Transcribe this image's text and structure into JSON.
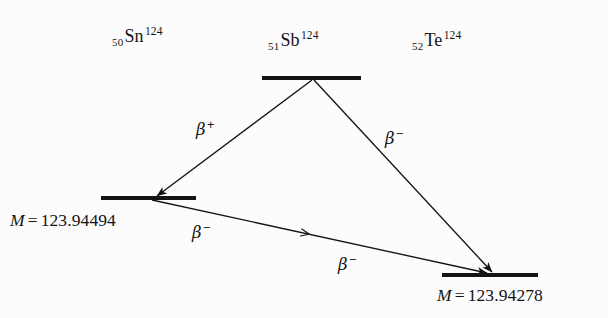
{
  "figure": {
    "background_color": "#fcfcfc",
    "ink_color": "#141414",
    "width": 608,
    "height": 318
  },
  "nuclides": [
    {
      "key": "sn",
      "z": "50",
      "symbol": "Sn",
      "a": "124",
      "label_x": 112,
      "label_y": 26
    },
    {
      "key": "sb",
      "z": "51",
      "symbol": "Sb",
      "a": "124",
      "label_x": 268,
      "label_y": 30
    },
    {
      "key": "te",
      "z": "52",
      "symbol": "Te",
      "a": "124",
      "label_x": 412,
      "label_y": 30
    }
  ],
  "levels": [
    {
      "key": "sb-level",
      "name": "antimony-124-level",
      "x1": 262,
      "x2": 361,
      "y": 78
    },
    {
      "key": "sn-level",
      "name": "tin-124-level",
      "x1": 101,
      "x2": 196,
      "y": 198
    },
    {
      "key": "te-level",
      "name": "tellurium-124-level",
      "x1": 442,
      "x2": 538,
      "y": 275
    }
  ],
  "masses": [
    {
      "key": "sn-mass",
      "m_symbol": "M",
      "equals": "=",
      "value": "123.94494",
      "label_x": 10,
      "label_y": 212
    },
    {
      "key": "te-mass",
      "m_symbol": "M",
      "equals": "=",
      "value": "123.94278",
      "label_x": 437,
      "label_y": 287
    }
  ],
  "transitions": [
    {
      "key": "sb-to-sn",
      "name": "beta-plus-sb-to-sn",
      "from": "sb",
      "to": "sn",
      "mode": "beta-plus",
      "beta": "β",
      "charge": "+",
      "x1": 312,
      "y1": 80,
      "x2": 157,
      "y2": 196,
      "label_x": 196,
      "label_y": 119,
      "arrowhead": "end"
    },
    {
      "key": "sb-to-te",
      "name": "beta-minus-sb-to-te",
      "from": "sb",
      "to": "te",
      "mode": "beta-minus",
      "beta": "β",
      "charge": "−",
      "x1": 314,
      "y1": 80,
      "x2": 492,
      "y2": 272,
      "label_x": 385,
      "label_y": 128,
      "arrowhead": "end"
    },
    {
      "key": "sn-to-te",
      "name": "beta-minus-sn-to-te",
      "from": "sn",
      "to": "te",
      "mode": "beta-minus",
      "beta": "β",
      "charge": "−",
      "x1": 152,
      "y1": 200,
      "x2": 487,
      "y2": 273,
      "label_x": 192,
      "label_y": 222,
      "label2_x": 338,
      "label2_y": 254,
      "arrowhead": "end-and-mid",
      "mid_marker_t": 0.46
    }
  ]
}
